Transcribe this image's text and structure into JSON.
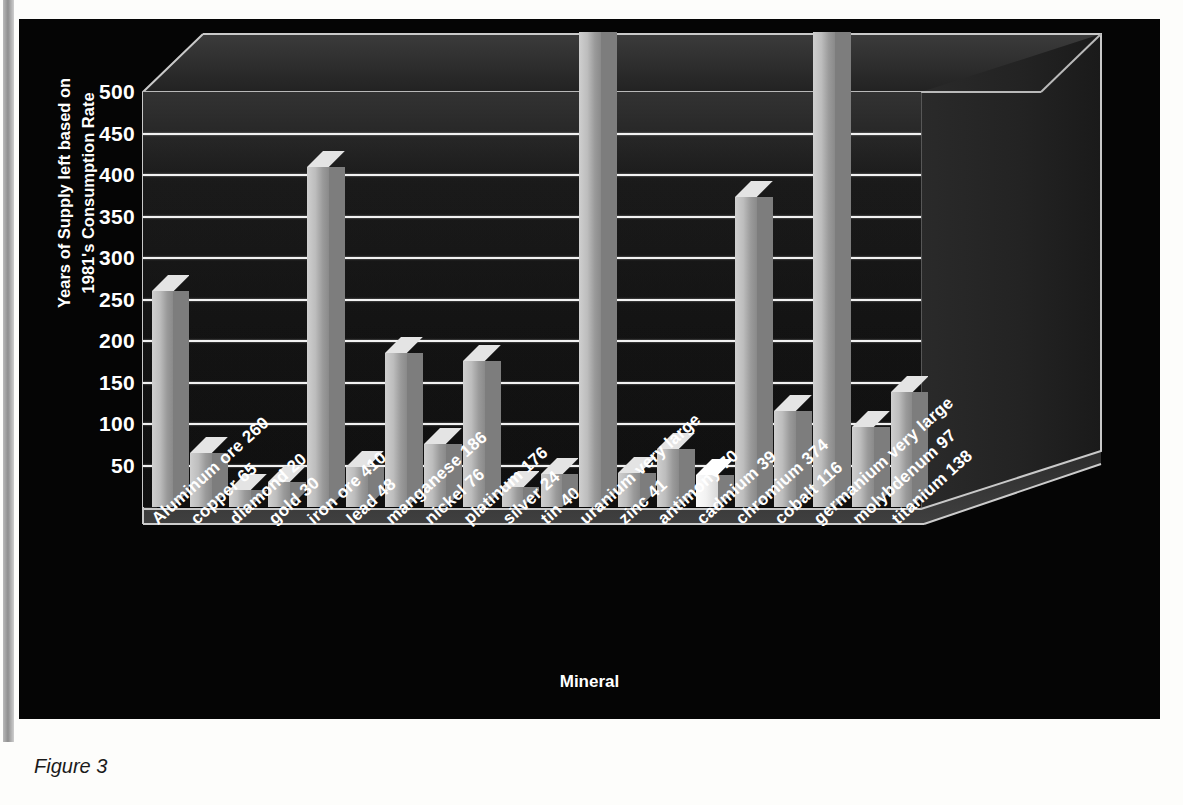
{
  "figure": {
    "caption": "Figure 3"
  },
  "chart_data": {
    "type": "bar",
    "title": "",
    "xlabel": "Mineral",
    "ylabel": "Years of Supply left based on 1981's Consumption Rate",
    "ylim": [
      0,
      500
    ],
    "ytick_labels": [
      "500",
      "450",
      "400",
      "350",
      "300",
      "250",
      "200",
      "150",
      "100",
      "50"
    ],
    "ytick_values": [
      500,
      450,
      400,
      350,
      300,
      250,
      200,
      150,
      100,
      50
    ],
    "grid": true,
    "legend": "none",
    "style": "3d-column",
    "categories": [
      "Aluminum ore 260",
      "copper 65",
      "diamond 20",
      "gold 30",
      "iron ore 410",
      "lead 48",
      "manganese 186",
      "nickel 76",
      "platinum 176",
      "silver 24",
      "tin 40",
      "uranium very large",
      "zinc 41",
      "antimony 70",
      "cadmium 39",
      "chromium 374",
      "cobalt 116",
      "germanium very large",
      "molybdenum 97",
      "titanium 138"
    ],
    "values": [
      260,
      65,
      20,
      30,
      410,
      48,
      186,
      76,
      176,
      24,
      40,
      520,
      41,
      70,
      39,
      374,
      116,
      520,
      97,
      138
    ],
    "value_notes": [
      "",
      "",
      "",
      "",
      "",
      "",
      "",
      "",
      "",
      "",
      "",
      "very large (off scale)",
      "",
      "",
      "",
      "",
      "",
      "very large (off scale)",
      "",
      ""
    ]
  },
  "axis": {
    "y_title_line1": "Years of Supply left based on",
    "y_title_line2": "1981's Consumption Rate",
    "x_title": "Mineral"
  },
  "colors": {
    "panel_background": "#050505",
    "gridline": "#f2f2f2",
    "bar_face": "#bdbdbd",
    "bar_highlight": "#f2f2f2",
    "text": "#ffffff",
    "caption": "#1a1a1a"
  }
}
